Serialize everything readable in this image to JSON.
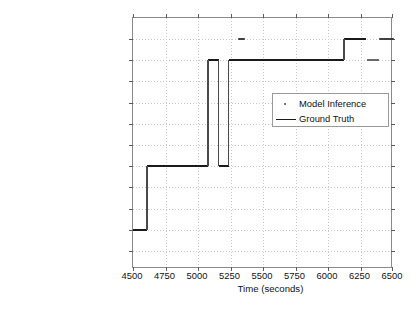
{
  "chart_data": {
    "type": "line",
    "title": "",
    "subtitle": "",
    "xlabel": "Time (seconds)",
    "ylabel": "",
    "xlim": [
      4500,
      6500
    ],
    "xticks": [
      4500,
      4750,
      5000,
      5250,
      5500,
      5750,
      6000,
      6250,
      6500
    ],
    "xtick_labels": [
      "4500",
      "4750",
      "5000",
      "5250",
      "5500",
      "5750",
      "6000",
      "6250",
      "6500"
    ],
    "grid": true,
    "legend_position": "center-right",
    "categories": [
      "Use The Bathroom",
      "Make Espresso",
      "Make Tea",
      "Make Juice",
      "Make Oatmeal",
      "Make Soft Boiled Eggs",
      "Use The Phone",
      "Take out trash",
      "Set The Table",
      "Eat Breakfast",
      "Clear The Table"
    ],
    "series": [
      {
        "name": "Ground Truth",
        "style": "step-line",
        "color": "#1a1a1a",
        "segments": [
          {
            "category": "Make Espresso",
            "x_start": 4500,
            "x_end": 4608
          },
          {
            "category": "Make Oatmeal",
            "x_start": 4608,
            "x_end": 5078
          },
          {
            "category": "Eat Breakfast",
            "x_start": 5078,
            "x_end": 5158
          },
          {
            "category": "Make Oatmeal",
            "x_start": 5158,
            "x_end": 5235
          },
          {
            "category": "Eat Breakfast",
            "x_start": 5235,
            "x_end": 6122
          },
          {
            "category": "Clear The Table",
            "x_start": 6122,
            "x_end": 6290
          }
        ]
      },
      {
        "name": "Model Inference",
        "style": "dots",
        "color": "#3a3a3a",
        "segments": [
          {
            "category": "Clear The Table",
            "x_start": 5310,
            "x_end": 5355
          },
          {
            "category": "Eat Breakfast",
            "x_start": 6300,
            "x_end": 6385
          },
          {
            "category": "Clear The Table",
            "x_start": 6395,
            "x_end": 6500
          }
        ]
      }
    ]
  },
  "legend": {
    "entries": [
      {
        "label": "Model Inference",
        "key": "dot-marker"
      },
      {
        "label": "Ground Truth",
        "key": "line-marker"
      }
    ]
  }
}
